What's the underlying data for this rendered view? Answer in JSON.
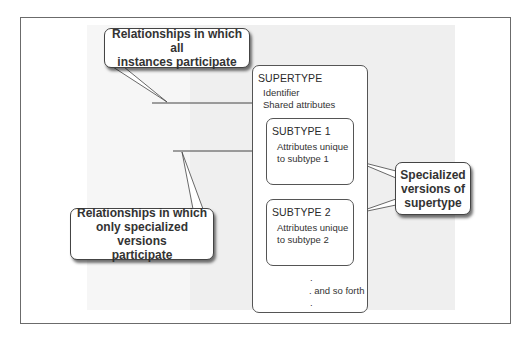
{
  "diagram": {
    "supertype": {
      "title": "SUPERTYPE",
      "attributes": [
        "Identifier",
        "Shared attributes"
      ]
    },
    "subtypes": [
      {
        "title": "SUBTYPE 1",
        "attributes": [
          "Attributes unique",
          "to subtype 1"
        ]
      },
      {
        "title": "SUBTYPE 2",
        "attributes": [
          "Attributes unique",
          "to subtype 2"
        ]
      }
    ],
    "continuation": {
      "dot_top": ".",
      "label": ". and so forth",
      "dot_bottom": "."
    },
    "callouts": {
      "all_instances": "Relationships in which all\ninstances participate",
      "specialized": "Relationships in which\nonly specialized versions\nparticipate",
      "specialized_versions": "Specialized\nversions of\nsupertype"
    }
  },
  "colors": {
    "frame": "#6b6b6b",
    "panel": "#efefef",
    "line": "#444444"
  }
}
